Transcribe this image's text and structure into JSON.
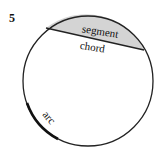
{
  "figure_number": "5",
  "labels": {
    "segment": "segment",
    "chord": "chord",
    "arc": "arc"
  },
  "colors": {
    "segment_fill": "#d4d4d4",
    "stroke": "#222222"
  }
}
